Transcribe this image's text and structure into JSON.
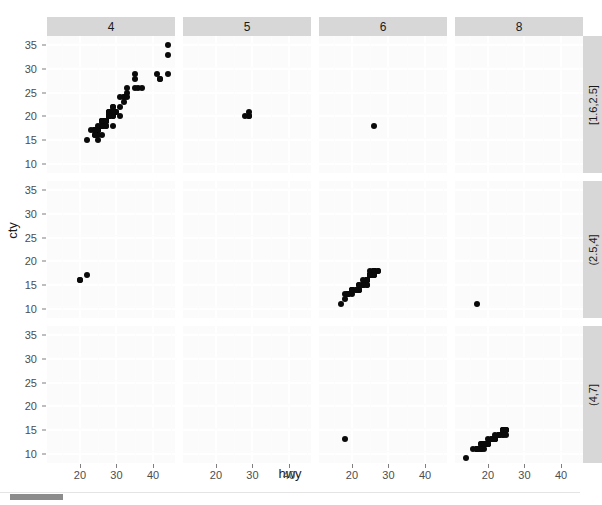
{
  "chart_data": {
    "type": "scatter",
    "title": "",
    "xlabel": "hwy",
    "ylabel": "cty",
    "xlim": [
      11,
      46
    ],
    "ylim": [
      8,
      37
    ],
    "xticks": [
      20,
      30,
      40
    ],
    "yticks": [
      10,
      15,
      20,
      25,
      30,
      35
    ],
    "grid": true,
    "legend": "none",
    "facet": {
      "col_var": "cyl",
      "row_var": "displ",
      "col_labels": [
        "4",
        "5",
        "6",
        "8"
      ],
      "row_labels": [
        "[1.6,2.5]",
        "(2.5,4]",
        "(4,7]"
      ]
    },
    "point_color": "#0a0a0a",
    "panels": [
      {
        "col": "4",
        "row": "[1.6,2.5]",
        "points": [
          [
            29,
            18
          ],
          [
            29,
            21
          ],
          [
            31,
            20
          ],
          [
            30,
            21
          ],
          [
            26,
            16
          ],
          [
            26,
            18
          ],
          [
            27,
            18
          ],
          [
            26,
            18
          ],
          [
            25,
            16
          ],
          [
            28,
            20
          ],
          [
            27,
            19
          ],
          [
            25,
            15
          ],
          [
            25,
            17
          ],
          [
            25,
            17
          ],
          [
            24,
            16
          ],
          [
            25,
            17
          ],
          [
            26,
            18
          ],
          [
            23,
            17
          ],
          [
            24,
            17
          ],
          [
            26,
            19
          ],
          [
            26,
            19
          ],
          [
            26,
            19
          ],
          [
            25,
            17
          ],
          [
            28,
            20
          ],
          [
            24,
            17
          ],
          [
            27,
            19
          ],
          [
            30,
            21
          ],
          [
            31,
            22
          ],
          [
            26,
            18
          ],
          [
            26,
            18
          ],
          [
            27,
            18
          ],
          [
            29,
            21
          ],
          [
            24,
            17
          ],
          [
            24,
            17
          ],
          [
            26,
            18
          ],
          [
            26,
            18
          ],
          [
            26,
            18
          ],
          [
            29,
            20
          ],
          [
            26,
            19
          ],
          [
            26,
            19
          ],
          [
            29,
            21
          ],
          [
            28,
            20
          ],
          [
            27,
            19
          ],
          [
            24,
            16
          ],
          [
            24,
            17
          ],
          [
            24,
            17
          ],
          [
            22,
            15
          ],
          [
            29,
            20
          ],
          [
            29,
            21
          ],
          [
            28,
            21
          ],
          [
            28,
            20
          ],
          [
            27,
            19
          ],
          [
            32,
            24
          ],
          [
            33,
            26
          ],
          [
            32,
            24
          ],
          [
            35,
            28
          ],
          [
            35,
            29
          ],
          [
            44,
            33
          ],
          [
            44,
            35
          ],
          [
            41,
            29
          ],
          [
            36,
            26
          ],
          [
            35,
            26
          ],
          [
            37,
            26
          ],
          [
            33,
            25
          ],
          [
            28,
            21
          ],
          [
            31,
            24
          ],
          [
            28,
            21
          ],
          [
            29,
            22
          ],
          [
            33,
            24
          ],
          [
            29,
            22
          ],
          [
            26,
            18
          ],
          [
            27,
            19
          ],
          [
            25,
            18
          ],
          [
            24,
            17
          ],
          [
            29,
            21
          ],
          [
            28,
            20
          ],
          [
            24,
            17
          ],
          [
            27,
            19
          ],
          [
            32,
            23
          ],
          [
            42,
            28
          ],
          [
            42,
            28
          ],
          [
            44,
            29
          ]
        ]
      },
      {
        "col": "5",
        "row": "[1.6,2.5]",
        "points": [
          [
            29,
            20
          ],
          [
            29,
            20
          ],
          [
            29,
            21
          ],
          [
            28,
            20
          ]
        ]
      },
      {
        "col": "6",
        "row": "[1.6,2.5]",
        "points": [
          [
            26,
            18
          ]
        ]
      },
      {
        "col": "8",
        "row": "[1.6,2.5]",
        "points": []
      },
      {
        "col": "4",
        "row": "(2.5,4]",
        "points": [
          [
            20,
            16
          ],
          [
            20,
            16
          ],
          [
            22,
            17
          ]
        ]
      },
      {
        "col": "6",
        "row": "(2.5,4]",
        "points": [
          [
            26,
            18
          ],
          [
            25,
            18
          ],
          [
            26,
            18
          ],
          [
            24,
            16
          ],
          [
            25,
            17
          ],
          [
            26,
            17
          ],
          [
            26,
            18
          ],
          [
            26,
            17
          ],
          [
            25,
            17
          ],
          [
            24,
            16
          ],
          [
            24,
            15
          ],
          [
            22,
            14
          ],
          [
            22,
            14
          ],
          [
            23,
            15
          ],
          [
            24,
            15
          ],
          [
            23,
            15
          ],
          [
            22,
            14
          ],
          [
            20,
            13
          ],
          [
            19,
            13
          ],
          [
            20,
            14
          ],
          [
            19,
            13
          ],
          [
            18,
            13
          ],
          [
            19,
            13
          ],
          [
            20,
            14
          ],
          [
            20,
            14
          ],
          [
            22,
            15
          ],
          [
            21,
            14
          ],
          [
            23,
            16
          ],
          [
            24,
            16
          ],
          [
            25,
            17
          ],
          [
            25,
            17
          ],
          [
            26,
            18
          ],
          [
            26,
            18
          ],
          [
            27,
            18
          ],
          [
            27,
            18
          ],
          [
            26,
            17
          ],
          [
            24,
            16
          ],
          [
            23,
            15
          ],
          [
            24,
            16
          ],
          [
            25,
            17
          ],
          [
            19,
            13
          ],
          [
            18,
            12
          ],
          [
            20,
            14
          ],
          [
            21,
            14
          ],
          [
            22,
            15
          ],
          [
            17,
            11
          ]
        ]
      },
      {
        "col": "8",
        "row": "(2.5,4]",
        "points": [
          [
            17,
            11
          ]
        ]
      },
      {
        "col": "4",
        "row": "(4,7]",
        "points": []
      },
      {
        "col": "6",
        "row": "(4,7]",
        "points": [
          [
            18,
            13
          ]
        ]
      },
      {
        "col": "8",
        "row": "(4,7]",
        "points": [
          [
            24,
            15
          ],
          [
            24,
            15
          ],
          [
            25,
            15
          ],
          [
            25,
            14
          ],
          [
            23,
            14
          ],
          [
            24,
            14
          ],
          [
            23,
            14
          ],
          [
            22,
            13
          ],
          [
            22,
            13
          ],
          [
            21,
            13
          ],
          [
            20,
            12
          ],
          [
            20,
            12
          ],
          [
            19,
            12
          ],
          [
            19,
            11
          ],
          [
            18,
            11
          ],
          [
            18,
            11
          ],
          [
            17,
            11
          ],
          [
            17,
            11
          ],
          [
            18,
            12
          ],
          [
            19,
            12
          ],
          [
            20,
            12
          ],
          [
            21,
            13
          ],
          [
            22,
            13
          ],
          [
            23,
            14
          ],
          [
            24,
            14
          ],
          [
            25,
            15
          ],
          [
            24,
            15
          ],
          [
            23,
            14
          ],
          [
            22,
            13
          ],
          [
            20,
            12
          ],
          [
            19,
            12
          ],
          [
            18,
            11
          ],
          [
            17,
            11
          ],
          [
            16,
            11
          ],
          [
            17,
            11
          ],
          [
            18,
            12
          ],
          [
            19,
            12
          ],
          [
            20,
            13
          ],
          [
            21,
            13
          ],
          [
            22,
            14
          ],
          [
            24,
            15
          ],
          [
            25,
            15
          ],
          [
            14,
            9
          ]
        ]
      }
    ]
  },
  "scrollbar": {
    "orientation": "horizontal"
  }
}
